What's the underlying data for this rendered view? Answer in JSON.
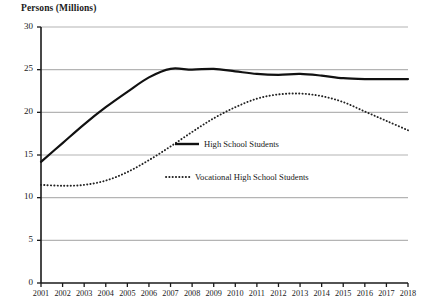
{
  "chart_data": {
    "type": "line",
    "title": "Persons (Millions)",
    "xlabel": "",
    "ylabel": "Persons (Millions)",
    "ylim": [
      0,
      30
    ],
    "yticks": [
      0,
      5,
      10,
      15,
      20,
      25,
      30
    ],
    "grid": true,
    "legend_position": "center-right",
    "x": [
      2001,
      2002,
      2003,
      2004,
      2005,
      2006,
      2007,
      2008,
      2009,
      2010,
      2011,
      2012,
      2013,
      2014,
      2015,
      2016,
      2017,
      2018
    ],
    "categories": [
      "2001",
      "2002",
      "2003",
      "2004",
      "2005",
      "2006",
      "2007",
      "2008",
      "2009",
      "2010",
      "2011",
      "2012",
      "2013",
      "2014",
      "2015",
      "2016",
      "2017",
      "2018"
    ],
    "series": [
      {
        "name": "High School Students",
        "style": "solid",
        "color": "#111111",
        "values": [
          14.2,
          16.4,
          18.6,
          20.6,
          22.4,
          24.1,
          25.1,
          25.0,
          25.1,
          24.8,
          24.5,
          24.4,
          24.5,
          24.3,
          24.0,
          23.9,
          23.9,
          23.9
        ]
      },
      {
        "name": "Vocational High School Students",
        "style": "dotted",
        "color": "#222222",
        "values": [
          11.5,
          11.4,
          11.5,
          12.0,
          13.0,
          14.4,
          16.0,
          17.7,
          19.3,
          20.6,
          21.6,
          22.1,
          22.2,
          21.9,
          21.2,
          20.1,
          19.0,
          17.9
        ]
      }
    ]
  },
  "axis": {
    "y_title": "Persons (Millions)",
    "y_labels": [
      "30",
      "25",
      "20",
      "15",
      "10",
      "5",
      "0"
    ],
    "x_labels": [
      "2001",
      "2002",
      "2003",
      "2004",
      "2005",
      "2006",
      "2007",
      "2008",
      "2009",
      "2010",
      "2011",
      "2012",
      "2013",
      "2014",
      "2015",
      "2016",
      "2017",
      "2018"
    ]
  },
  "legend": {
    "items": [
      {
        "label": "High School Students",
        "style": "solid"
      },
      {
        "label": "Vocational High School Students",
        "style": "dotted"
      }
    ]
  },
  "colors": {
    "line": "#111111",
    "grid": "#b4b4b4",
    "axis": "#1a1a1a",
    "background": "#ffffff"
  }
}
